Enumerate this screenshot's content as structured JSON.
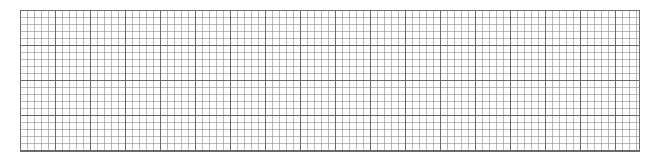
{
  "canvas": {
    "width": 658,
    "height": 157,
    "background": "#ffffff"
  },
  "grid": {
    "description": "graph-paper grid",
    "left": 20,
    "top": 10,
    "width": 620,
    "height": 142,
    "minor_cell_px": 7,
    "major_every_cells": 5,
    "line_color": "#808080",
    "border_color": "#6e6e6e"
  }
}
